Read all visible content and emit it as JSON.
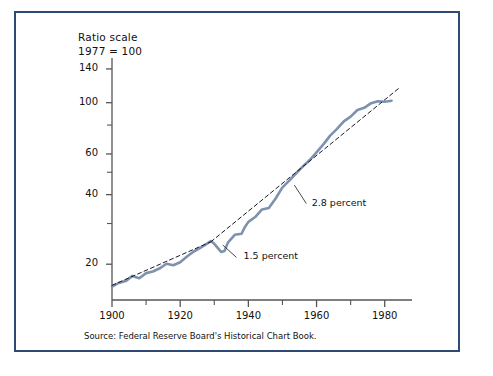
{
  "header": {
    "line1": "Ratio scale",
    "line2": "1977 = 100"
  },
  "source": "Source: Federal Reserve Board's Historical Chart Book.",
  "colors": {
    "frame": "#2e4a72",
    "series": "#7e92ae",
    "trend": "#1a1a2e",
    "axis": "#555555",
    "text": "#111111"
  },
  "chart_data": {
    "type": "line",
    "title": "",
    "subtitle": "Ratio scale, 1977 = 100",
    "xlabel": "",
    "ylabel": "",
    "yscale": "log",
    "ylim": [
      14,
      150
    ],
    "xlim": [
      1900,
      1988
    ],
    "grid": false,
    "legend_position": "none",
    "y_ticks_labeled": [
      140,
      100,
      60,
      40,
      20
    ],
    "y_ticks_minor": [
      80,
      50,
      30
    ],
    "x_ticks_labeled": [
      1900,
      1920,
      1940,
      1960,
      1980
    ],
    "x_ticks_minor": [
      1910,
      1930,
      1950,
      1970
    ],
    "annotations": [
      {
        "text": "1.5 percent",
        "x": 1938,
        "y": 21.5
      },
      {
        "text": "2.8 percent",
        "x": 1958,
        "y": 36.5
      }
    ],
    "series": [
      {
        "name": "Output per hour",
        "style": "solid",
        "x": [
          1900,
          1902,
          1904,
          1906,
          1908,
          1910,
          1912,
          1914,
          1916,
          1918,
          1920,
          1922,
          1924,
          1926,
          1928,
          1929,
          1930,
          1932,
          1933,
          1934,
          1936,
          1938,
          1939,
          1940,
          1942,
          1944,
          1946,
          1948,
          1950,
          1952,
          1954,
          1956,
          1958,
          1960,
          1962,
          1964,
          1966,
          1968,
          1970,
          1972,
          1974,
          1976,
          1978,
          1980,
          1982
        ],
        "y": [
          16.0,
          16.6,
          16.9,
          17.8,
          17.4,
          18.3,
          18.6,
          19.2,
          20.1,
          19.8,
          20.4,
          21.6,
          22.7,
          23.6,
          24.6,
          25.2,
          24.5,
          22.6,
          22.8,
          24.8,
          26.8,
          27.1,
          29.0,
          30.5,
          32.0,
          34.5,
          35.0,
          38.5,
          43.0,
          46.0,
          49.5,
          53.0,
          56.5,
          61.0,
          66.0,
          72.0,
          77.0,
          83.0,
          87.0,
          93.0,
          95.0,
          99.5,
          101.5,
          101.0,
          102.0
        ]
      },
      {
        "name": "1.5 percent trend",
        "style": "dashed",
        "x": [
          1900,
          1929
        ],
        "y": [
          16.2,
          25.0
        ]
      },
      {
        "name": "2.8 percent trend",
        "style": "dashed",
        "x": [
          1929,
          1984
        ],
        "y": [
          25.0,
          115.0
        ]
      }
    ]
  }
}
